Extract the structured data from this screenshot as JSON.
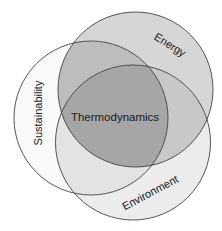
{
  "diagram": {
    "type": "venn",
    "sets": [
      {
        "id": "energy",
        "label": "Energy",
        "cx": 135.5,
        "cy": 89.5,
        "r": 77.5
      },
      {
        "id": "sustainability",
        "label": "Sustainability",
        "cx": 91,
        "cy": 118,
        "r": 77
      },
      {
        "id": "environment",
        "label": "Environment",
        "cx": 133,
        "cy": 142.5,
        "r": 77.5
      }
    ],
    "center_label": "Thermodynamics",
    "colors": {
      "energy_fill": "#d6d6d6",
      "sustainability_fill": "#f9f9f9",
      "environment_fill": "#ececec",
      "energy_sustainability": "#bdbdbd",
      "energy_environment": "#c8c8c8",
      "sustainability_environment": "#e3e3e3",
      "center": "#a6a6a6",
      "stroke": "#444444"
    }
  }
}
